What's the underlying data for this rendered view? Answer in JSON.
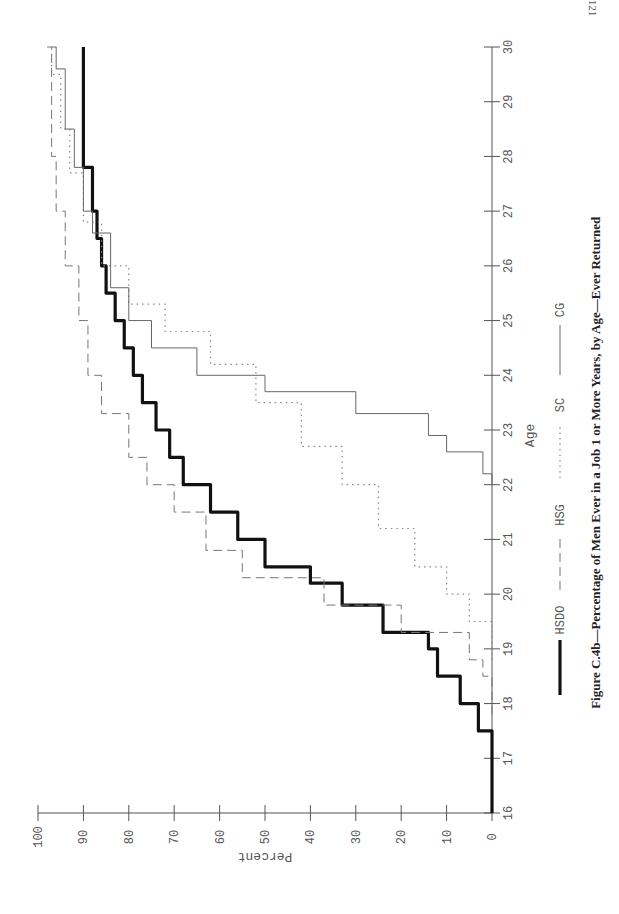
{
  "page": {
    "number": "121"
  },
  "figure": {
    "caption": "Figure C.4b—Percentage of Men Ever in a Job 1 or More Years, by Age—Ever Returned"
  },
  "chart_data": {
    "type": "line",
    "title": "Figure C.4b—Percentage of Men Ever in a Job 1 or More Years, by Age—Ever Returned",
    "orientation": "rotated 90° clockwise (landscape figure on portrait page)",
    "xlabel": "Age",
    "ylabel": "Percent",
    "xlim": [
      16,
      30
    ],
    "ylim": [
      0,
      100
    ],
    "x_ticks": [
      16,
      17,
      18,
      19,
      20,
      21,
      22,
      23,
      24,
      25,
      26,
      27,
      28,
      29,
      30
    ],
    "y_ticks": [
      0,
      10,
      20,
      30,
      40,
      50,
      60,
      70,
      80,
      90,
      100
    ],
    "grid": false,
    "legend_position": "below x-axis label",
    "legend": [
      "HSDO",
      "HSG",
      "SC",
      "CG"
    ],
    "series": [
      {
        "name": "HSDO",
        "style": "thick-solid",
        "color": "#111111",
        "points": [
          [
            16,
            0
          ],
          [
            17.1,
            0
          ],
          [
            17.5,
            3
          ],
          [
            18,
            7
          ],
          [
            18.5,
            12
          ],
          [
            19,
            14
          ],
          [
            19.3,
            24
          ],
          [
            19.8,
            33
          ],
          [
            20.2,
            40
          ],
          [
            20.5,
            50
          ],
          [
            21,
            56
          ],
          [
            21.5,
            62
          ],
          [
            22,
            68
          ],
          [
            22.5,
            71
          ],
          [
            23,
            74
          ],
          [
            23.5,
            77
          ],
          [
            24,
            79
          ],
          [
            24.5,
            81
          ],
          [
            25,
            83
          ],
          [
            25.5,
            85
          ],
          [
            26,
            86
          ],
          [
            26.5,
            87
          ],
          [
            27,
            88
          ],
          [
            27.8,
            90
          ],
          [
            30,
            90
          ]
        ]
      },
      {
        "name": "HSG",
        "style": "dashed",
        "color": "#777777",
        "points": [
          [
            17.8,
            0
          ],
          [
            18.5,
            2
          ],
          [
            18.8,
            5
          ],
          [
            19.3,
            20
          ],
          [
            19.8,
            37
          ],
          [
            20.3,
            55
          ],
          [
            20.8,
            63
          ],
          [
            21.5,
            70
          ],
          [
            22,
            76
          ],
          [
            22.5,
            80
          ],
          [
            23.3,
            86
          ],
          [
            24,
            89
          ],
          [
            25,
            91
          ],
          [
            26,
            94
          ],
          [
            27,
            96
          ],
          [
            28,
            97
          ],
          [
            30,
            98
          ]
        ]
      },
      {
        "name": "SC",
        "style": "dotted",
        "color": "#888888",
        "points": [
          [
            18.8,
            0
          ],
          [
            19.5,
            5
          ],
          [
            20,
            10
          ],
          [
            20.5,
            17
          ],
          [
            21.2,
            25
          ],
          [
            22,
            33
          ],
          [
            22.7,
            42
          ],
          [
            23.5,
            52
          ],
          [
            24.2,
            62
          ],
          [
            24.8,
            72
          ],
          [
            25.3,
            80
          ],
          [
            26,
            86
          ],
          [
            26.8,
            90
          ],
          [
            27.7,
            93
          ],
          [
            28.5,
            95
          ],
          [
            29.5,
            97
          ],
          [
            30,
            97
          ]
        ]
      },
      {
        "name": "CG",
        "style": "thin-solid",
        "color": "#666666",
        "points": [
          [
            22,
            0
          ],
          [
            22.2,
            2
          ],
          [
            22.6,
            10
          ],
          [
            22.9,
            14
          ],
          [
            23.3,
            30
          ],
          [
            23.7,
            50
          ],
          [
            24,
            65
          ],
          [
            24.5,
            75
          ],
          [
            25,
            80
          ],
          [
            25.6,
            84
          ],
          [
            26.6,
            88
          ],
          [
            27,
            90
          ],
          [
            27.8,
            92
          ],
          [
            28.5,
            94
          ],
          [
            29.6,
            96
          ],
          [
            30,
            97
          ]
        ]
      }
    ]
  },
  "geometry": {
    "age_axis_x": 492,
    "age16_y": 813,
    "age30_y": 47,
    "pct0_x": 492,
    "pct100_x": 38,
    "pct_axis_y": 813
  }
}
